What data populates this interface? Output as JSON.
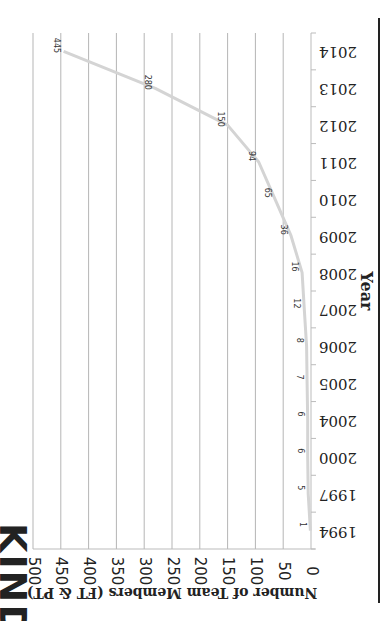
{
  "title_fragment": "KIND",
  "chart_data": {
    "type": "line",
    "orientation": "rotated-90-clockwise",
    "title": "",
    "xlabel": "Year",
    "ylabel": "Number of Team Members (FT & PT)",
    "categories": [
      "1994",
      "1997",
      "2000",
      "2004",
      "2005",
      "2006",
      "2007",
      "2008",
      "2009",
      "2010",
      "2011",
      "2012",
      "2013",
      "2014"
    ],
    "series": [
      {
        "name": "Team Members",
        "values": [
          1,
          5,
          6,
          6,
          7,
          8,
          12,
          16,
          36,
          65,
          94,
          150,
          280,
          445
        ],
        "color": "#d3d3d3"
      }
    ],
    "data_labels": [
      "1",
      "5",
      "6",
      "6",
      "7",
      "8",
      "12",
      "16",
      "36",
      "65",
      "94",
      "150",
      "280",
      "445"
    ],
    "ylim": [
      0,
      500
    ],
    "yticks": [
      "0",
      "50",
      "100",
      "150",
      "200",
      "250",
      "300",
      "350",
      "400",
      "450",
      "500"
    ],
    "grid": true,
    "legend": "none"
  }
}
